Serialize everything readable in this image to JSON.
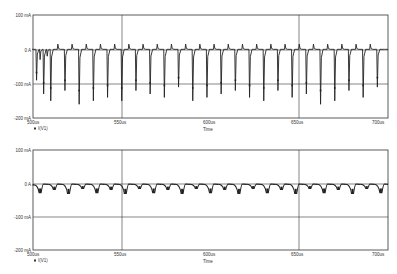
{
  "chart_data": [
    {
      "type": "line",
      "title": "",
      "xlabel": "Time",
      "ylabel": "",
      "x_tick_labels": [
        "500us",
        "550us",
        "600us",
        "650us",
        "700us"
      ],
      "y_tick_labels": [
        "100 mA",
        "0 A",
        "-100 mA",
        "-200 mA"
      ],
      "y_ticks": [
        100,
        0,
        -100,
        -200
      ],
      "xlim": [
        500,
        700
      ],
      "ylim": [
        -200,
        100
      ],
      "grid": true,
      "legend": [
        "I(V1)"
      ],
      "legend_position": "bottom-left",
      "series": [
        {
          "name": "I(V1)",
          "description": "periodic current spikes; large negative spikes (~-90 to -160 mA) every ~8us with small positive spikes (~+15 mA) in between; baseline near 0 A with initial transient dip to ~-30 mA near 500-505us",
          "period_us": 8,
          "x": [
            500,
            502,
            504,
            506,
            508,
            510,
            514,
            518,
            522,
            526,
            530,
            534,
            538,
            542,
            546,
            550,
            554,
            558,
            562,
            566,
            570,
            574,
            578,
            582,
            586,
            590,
            594,
            598,
            602,
            606,
            610,
            614,
            618,
            622,
            626,
            630,
            634,
            638,
            642,
            646,
            650,
            654,
            658,
            662,
            666,
            670,
            674,
            678,
            682,
            686,
            690,
            694,
            698
          ],
          "values": [
            0,
            -90,
            -30,
            -130,
            -20,
            -150,
            15,
            -120,
            15,
            -160,
            15,
            -150,
            15,
            -140,
            15,
            -150,
            15,
            -120,
            15,
            -130,
            15,
            -140,
            15,
            -110,
            15,
            -150,
            15,
            -140,
            15,
            -130,
            15,
            -120,
            15,
            -140,
            15,
            -150,
            15,
            -120,
            15,
            -140,
            15,
            -130,
            15,
            -160,
            15,
            -150,
            15,
            -120,
            15,
            -140,
            15,
            -110,
            0
          ]
        }
      ]
    },
    {
      "type": "line",
      "title": "",
      "xlabel": "Time",
      "ylabel": "",
      "x_tick_labels": [
        "500us",
        "550us",
        "600us",
        "650us",
        "700us"
      ],
      "y_tick_labels": [
        "100 mA",
        "0 A",
        "-100 mA",
        "-200 mA"
      ],
      "y_ticks": [
        100,
        0,
        -100,
        -200
      ],
      "xlim": [
        500,
        700
      ],
      "ylim": [
        -200,
        100
      ],
      "grid": true,
      "legend": [
        "I(V1)"
      ],
      "legend_position": "bottom-left",
      "series": [
        {
          "name": "I(V1)",
          "description": "periodic ripple current between ~0 and ~-30 mA, period ~8us, alternating dip depths",
          "period_us": 8,
          "x": [
            500,
            504,
            508,
            512,
            516,
            520,
            524,
            528,
            532,
            536,
            540,
            544,
            548,
            552,
            556,
            560,
            564,
            568,
            572,
            576,
            580,
            584,
            588,
            592,
            596,
            600,
            604,
            608,
            612,
            616,
            620,
            624,
            628,
            632,
            636,
            640,
            644,
            648,
            652,
            656,
            660,
            664,
            668,
            672,
            676,
            680,
            684,
            688,
            692,
            696,
            700
          ],
          "values": [
            -5,
            -28,
            -3,
            -18,
            -3,
            -30,
            -3,
            -15,
            -3,
            -28,
            -3,
            -18,
            -3,
            -30,
            -3,
            -15,
            -3,
            -28,
            -3,
            -18,
            -3,
            -30,
            -3,
            -15,
            -3,
            -28,
            -3,
            -18,
            -3,
            -30,
            -3,
            -15,
            -3,
            -28,
            -3,
            -18,
            -3,
            -30,
            -3,
            -15,
            -3,
            -28,
            -3,
            -18,
            -3,
            -30,
            -3,
            -15,
            -3,
            -28,
            -3
          ]
        }
      ]
    }
  ],
  "charts": [
    {
      "legend_label": "I(V1)",
      "xlabel": "Time",
      "ticks": {
        "x0": "500us",
        "x1": "550us",
        "x2": "600us",
        "x3": "650us",
        "x4": "700us"
      },
      "yticks": {
        "y0": "100 mA",
        "y1": "0 A",
        "y2": "-100 mA",
        "y3": "-200 mA"
      }
    },
    {
      "legend_label": "I(V1)",
      "xlabel": "Time",
      "ticks": {
        "x0": "500us",
        "x1": "550us",
        "x2": "600us",
        "x3": "650us",
        "x4": "700us"
      },
      "yticks": {
        "y0": "100 mA",
        "y1": "0 A",
        "y2": "-100 mA",
        "y3": "-200 mA"
      }
    }
  ],
  "colors": {
    "trace": "#222222",
    "axis": "#333333",
    "grid": "#333333",
    "background": "#ffffff"
  }
}
